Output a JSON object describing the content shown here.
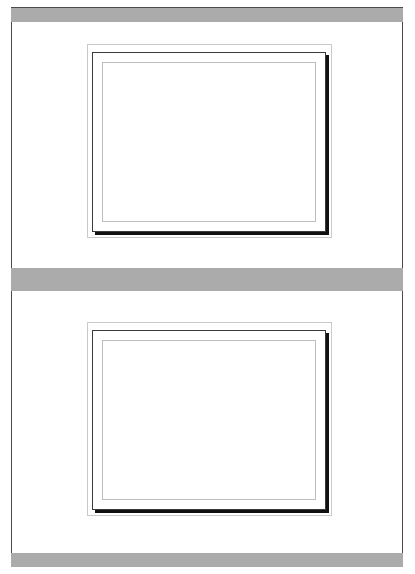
{
  "page": {
    "background_color": "#ffffff",
    "sheet_border_color": "#4a4a4a",
    "width": 415,
    "height": 574
  },
  "bands": [
    {
      "name": "top-band",
      "color": "#ababab",
      "label": ""
    },
    {
      "name": "middle-band",
      "color": "#ababab",
      "label": ""
    },
    {
      "name": "bottom-band",
      "color": "#ababab",
      "label": ""
    }
  ],
  "frames": [
    {
      "id": "frame-top",
      "label": "",
      "outer_border_color": "#c9c9c9",
      "mid_border_color": "#3a3a3a",
      "inner_border_color": "#bdbdbd",
      "shadow_color": "#111111",
      "fill_color": "#ffffff"
    },
    {
      "id": "frame-bottom",
      "label": "",
      "outer_border_color": "#c9c9c9",
      "mid_border_color": "#3a3a3a",
      "inner_border_color": "#bdbdbd",
      "shadow_color": "#111111",
      "fill_color": "#ffffff"
    }
  ]
}
